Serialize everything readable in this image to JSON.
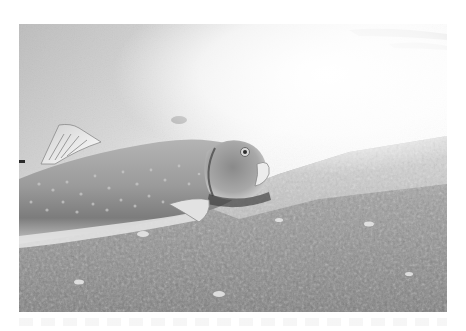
{
  "photo": {
    "subject": "fish lying on gravel riverbed underwater",
    "tone": "grayscale",
    "colors": {
      "page_background": "#ffffff",
      "water_light": "#f6f6f6",
      "water_mid": "#c9c9c9",
      "fish_body": "#9a9a9a",
      "fish_dark": "#5a5a5a",
      "gravel_light": "#bdbdbd",
      "gravel_dark": "#4a4a4a"
    }
  }
}
